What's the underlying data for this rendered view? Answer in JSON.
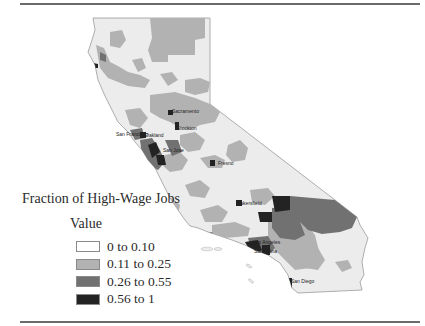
{
  "legend": {
    "title": "Fraction of High-Wage Jobs",
    "subtitle": "Value",
    "items": [
      {
        "label": "0 to 0.10",
        "color": "#ffffff"
      },
      {
        "label": "0.11 to 0.25",
        "color": "#b2b2b2"
      },
      {
        "label": "0.26 to 0.55",
        "color": "#717171"
      },
      {
        "label": "0.56 to 1",
        "color": "#232323"
      }
    ]
  },
  "map": {
    "region": "California",
    "base_color": "#ececec",
    "cities": [
      {
        "name": "Sacramento",
        "x": 172,
        "y": 113
      },
      {
        "name": "Stockton",
        "x": 177,
        "y": 130
      },
      {
        "name": "San Francisco",
        "x": 116,
        "y": 136
      },
      {
        "name": "Oakland",
        "x": 145,
        "y": 137
      },
      {
        "name": "San Jose",
        "x": 163,
        "y": 152
      },
      {
        "name": "Fresno",
        "x": 218,
        "y": 165
      },
      {
        "name": "Bakersfield",
        "x": 237,
        "y": 205
      },
      {
        "name": "Los Angeles",
        "x": 253,
        "y": 244
      },
      {
        "name": "Santa Ana",
        "x": 254,
        "y": 253
      },
      {
        "name": "San Diego",
        "x": 291,
        "y": 283
      }
    ]
  }
}
